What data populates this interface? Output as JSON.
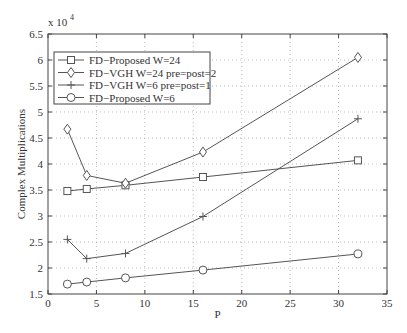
{
  "chart_data": {
    "type": "line",
    "title": "",
    "xlabel": "P",
    "ylabel": "Complex Multiplications",
    "y_exponent_label": "x 10",
    "y_exponent": "4",
    "xlim": [
      0,
      35
    ],
    "ylim": [
      1.5,
      6.5
    ],
    "xticks": [
      "0",
      "5",
      "10",
      "15",
      "20",
      "25",
      "30",
      "35"
    ],
    "yticks": [
      "1.5",
      "2",
      "2.5",
      "3",
      "3.5",
      "4",
      "4.5",
      "5",
      "5.5",
      "6",
      "6.5"
    ],
    "grid": true,
    "legend_position": "top-left",
    "x": [
      2,
      4,
      8,
      16,
      32
    ],
    "series": [
      {
        "name": "FD−Proposed  W=24",
        "marker": "square",
        "values": [
          3.48,
          3.52,
          3.59,
          3.75,
          4.07
        ]
      },
      {
        "name": "FD−VGH W=24 pre=post=2",
        "marker": "diamond",
        "values": [
          4.67,
          3.78,
          3.63,
          4.23,
          6.05
        ]
      },
      {
        "name": "FD−VGH W=6   pre=post=1",
        "marker": "plus",
        "values": [
          2.55,
          2.18,
          2.28,
          2.99,
          4.87
        ]
      },
      {
        "name": "FD−Proposed  W=6",
        "marker": "circle",
        "values": [
          1.69,
          1.73,
          1.81,
          1.96,
          2.27
        ]
      }
    ]
  }
}
